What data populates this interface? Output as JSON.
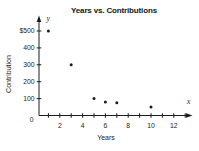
{
  "chart_data": {
    "type": "scatter",
    "title": "Years vs. Contributions",
    "xlabel": "Years",
    "ylabel": "Contribution",
    "points": [
      {
        "x": 1,
        "y": 500
      },
      {
        "x": 3,
        "y": 300
      },
      {
        "x": 5,
        "y": 100
      },
      {
        "x": 6,
        "y": 80
      },
      {
        "x": 7,
        "y": 75
      },
      {
        "x": 10,
        "y": 50
      }
    ],
    "xlim": [
      0,
      13
    ],
    "ylim": [
      0,
      560
    ],
    "x_ticks": [
      1,
      2,
      3,
      4,
      5,
      6,
      7,
      8,
      9,
      10,
      11,
      12,
      13
    ],
    "x_labeled_ticks": [
      {
        "value": 2,
        "label": "2"
      },
      {
        "value": 4,
        "label": "4"
      },
      {
        "value": 6,
        "label": "6"
      },
      {
        "value": 8,
        "label": "8"
      },
      {
        "value": 10,
        "label": "10"
      },
      {
        "value": 12,
        "label": "12"
      }
    ],
    "y_labeled_ticks": [
      {
        "value": 100,
        "label": "100"
      },
      {
        "value": 200,
        "label": "200"
      },
      {
        "value": 300,
        "label": "300"
      },
      {
        "value": 400,
        "label": "400"
      },
      {
        "value": 500,
        "label": "$500"
      }
    ],
    "origin_label": "0",
    "x_axis_letter": "x",
    "y_axis_letter": "y",
    "grid": false,
    "legend": false,
    "axis_color": "#1c1c1c",
    "dot_color": "#1c1c1c",
    "background": "#ffffff"
  }
}
